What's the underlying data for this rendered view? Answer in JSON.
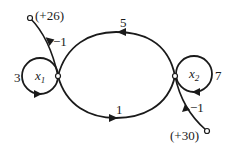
{
  "diagram": {
    "type": "signal-flow-graph",
    "nodes": [
      {
        "id": "x1",
        "label": "x",
        "subscript": "1"
      },
      {
        "id": "x2",
        "label": "x",
        "subscript": "2"
      }
    ],
    "inputs": [
      {
        "label": "(+26)",
        "target": "x1",
        "gain": "−1"
      },
      {
        "label": "(+30)",
        "target": "x2",
        "gain": "−1"
      }
    ],
    "edges": [
      {
        "from": "x1",
        "to": "x1",
        "gain": "3"
      },
      {
        "from": "x2",
        "to": "x2",
        "gain": "7"
      },
      {
        "from": "x2",
        "to": "x1",
        "gain": "5"
      },
      {
        "from": "x1",
        "to": "x2",
        "gain": "1"
      }
    ]
  }
}
